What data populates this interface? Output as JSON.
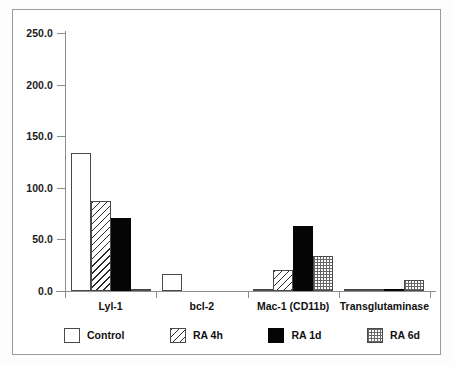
{
  "chart_data": {
    "type": "bar",
    "title": "",
    "subtitle": "",
    "xlabel": "",
    "ylabel": "",
    "categories": [
      "Lyl-1",
      "bcl-2",
      "Mac-1 (CD11b)",
      "Transglutaminase"
    ],
    "series": [
      {
        "name": "Control",
        "pattern": "open-white",
        "values": [
          134.0,
          16.5,
          1.0,
          0.5
        ]
      },
      {
        "name": "RA 4h",
        "pattern": "diagonal-hatch",
        "values": [
          87.0,
          0.0,
          20.0,
          0.5
        ]
      },
      {
        "name": "RA 1d",
        "pattern": "solid-black",
        "values": [
          71.0,
          0.0,
          63.0,
          0.5
        ]
      },
      {
        "name": "RA 6d",
        "pattern": "grid-check",
        "values": [
          0.5,
          0.0,
          34.0,
          11.0
        ]
      }
    ],
    "ylim": [
      0.0,
      250.0
    ],
    "yticks": [
      0.0,
      50.0,
      100.0,
      150.0,
      200.0,
      250.0
    ],
    "ytick_labels": [
      "0.0",
      "50.0",
      "100.0",
      "150.0",
      "200.0",
      "250.0"
    ],
    "grid": false,
    "legend_position": "bottom",
    "legend_entries": [
      "Control",
      "RA 4h",
      "RA 1d",
      "RA 6d"
    ],
    "axis_color": "#8d8d8d",
    "text_color": "#111111",
    "bar_outline_color": "#4a4a4a",
    "solid_fill_color": "#050505",
    "background_color": "#ffffff"
  }
}
